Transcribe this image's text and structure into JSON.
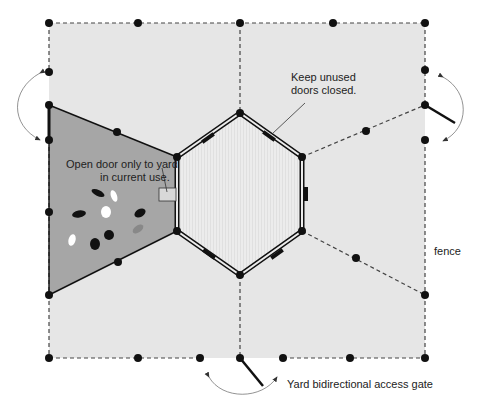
{
  "diagram": {
    "colors": {
      "background": "#ffffff",
      "yard_fill": "#e6e6e6",
      "active_yard_fill": "#a6a6a6",
      "coop_fill": "#ebebeb",
      "line": "#111111",
      "arrow": "#777777"
    },
    "labels": {
      "open_door_line1": "Open door only to yard",
      "open_door_line2": "in current use.",
      "keep_closed_line1": "Keep unused",
      "keep_closed_line2": "doors closed.",
      "fence": "fence",
      "access_gate": "Yard bidirectional access gate"
    },
    "nodes": {
      "coop": "Hexagonal coop",
      "active_yard": "Active yard (chickens)",
      "yards": [
        "Left yard (active)",
        "Top-left yard",
        "Top-right yard",
        "Right yard",
        "Bottom-right yard",
        "Bottom-left yard"
      ]
    },
    "gates": [
      "Left gate",
      "Right gate",
      "Bottom gate"
    ]
  }
}
